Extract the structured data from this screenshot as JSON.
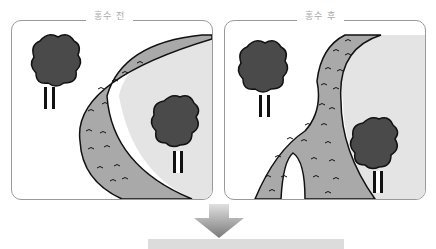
{
  "panels": [
    {
      "id": "before",
      "label": "홍수 전"
    },
    {
      "id": "after",
      "label": "홍수 후"
    }
  ],
  "colors": {
    "river_fill": "#a9a9a9",
    "land_fill": "#e4e4e4",
    "tree_fill": "#4a4a4a",
    "outline": "#111111",
    "panel_border": "#9a9a9a",
    "arrow": "#888888",
    "result_bar": "#dcdcdc"
  },
  "arrow": {
    "direction": "down"
  }
}
